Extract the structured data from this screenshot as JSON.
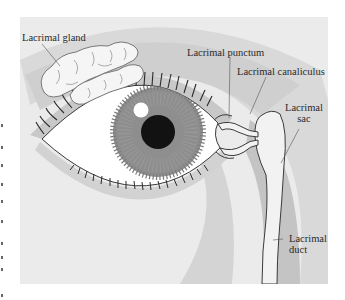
{
  "diagram": {
    "type": "anatomical-illustration",
    "labels": {
      "lacrimal_gland": "Lacrimal gland",
      "lacrimal_punctum": "Lacrimal punctum",
      "lacrimal_canaliculus": "Lacrimal canaliculus",
      "lacrimal_sac_line1": "Lacrimal",
      "lacrimal_sac_line2": "sac",
      "lacrimal_duct_line1": "Lacrimal",
      "lacrimal_duct_line2": "duct"
    },
    "colors": {
      "background": "#ebebeb",
      "outer_band": "#d6d6d6",
      "brow_band": "#c9c9c9",
      "iris": "#8c8c8c",
      "pupil": "#121212",
      "sclera": "#ffffff",
      "outline": "#3a3a3a",
      "gland": "#f4f4f4",
      "duct_fill": "#f2f2f2"
    }
  }
}
